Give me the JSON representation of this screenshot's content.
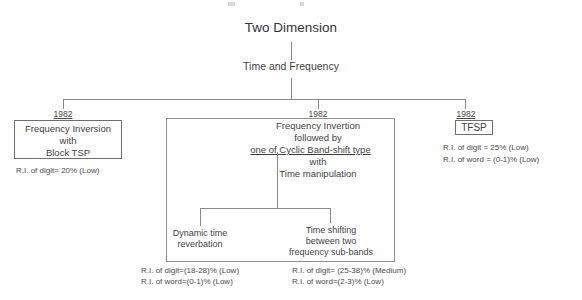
{
  "diagram": {
    "root": {
      "title": "Two Dimension",
      "subtitle": "Time and Frequency"
    },
    "branches": [
      {
        "id": "left",
        "year": "1982",
        "box_lines": [
          "Frequency Inversion",
          "with",
          "Block TSP"
        ],
        "metrics": [
          "R.I. of digit= 20% (Low)"
        ]
      },
      {
        "id": "center",
        "year": "1982",
        "box_lines": [
          "Frequency Invertion",
          "followed by",
          "one of Cyclic Band-shift type",
          "with",
          "Time manipulation"
        ],
        "metrics": [],
        "children": [
          {
            "id": "center-left",
            "label_lines": [
              "Dynamic time",
              "reverbation"
            ],
            "metrics": [
              "R.I. of digit=(18-28)% (Low)",
              "R.I. of word=(0-1)% (Low)"
            ]
          },
          {
            "id": "center-right",
            "label_lines": [
              "Time shifting",
              "between two",
              "frequency sub-bands"
            ],
            "metrics": [
              "R.I. of digit= (25-38)% (Medium)",
              "R.I. of word=(2-3)% (Low)"
            ]
          }
        ]
      },
      {
        "id": "right",
        "year": "1982",
        "box_lines": [
          "TFSP"
        ],
        "metrics": [
          "R.I. of digit = 25% (Low)",
          "R.I. of word = (0-1)% (Low)"
        ]
      }
    ],
    "colors": {
      "line": "#8a8a8a",
      "text": "#3f3f3f",
      "border": "#6e6e6e",
      "background": "#ffffff"
    }
  }
}
